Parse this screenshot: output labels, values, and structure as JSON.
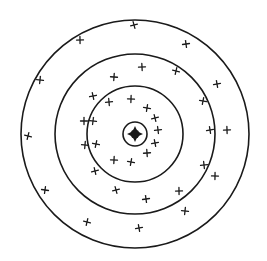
{
  "diagram": {
    "type": "target-scatter",
    "center": {
      "x": 135,
      "y": 134
    },
    "rings": [
      {
        "name": "outer-ring",
        "r": 114
      },
      {
        "name": "second-ring",
        "r": 80
      },
      {
        "name": "third-ring",
        "r": 48
      },
      {
        "name": "bullseye-ring",
        "r": 12
      }
    ],
    "bullseye": {
      "r": 6
    },
    "colors": {
      "stroke": "#1a1a1a",
      "background": "#ffffff"
    },
    "crosses": [
      [
        134,
        25
      ],
      [
        186,
        44
      ],
      [
        80,
        40
      ],
      [
        40,
        80
      ],
      [
        176,
        71
      ],
      [
        217,
        84
      ],
      [
        142,
        67
      ],
      [
        114,
        77
      ],
      [
        203,
        101
      ],
      [
        93,
        96
      ],
      [
        109,
        102
      ],
      [
        131,
        99
      ],
      [
        147,
        108
      ],
      [
        155,
        118
      ],
      [
        158,
        130
      ],
      [
        84,
        121
      ],
      [
        93,
        121
      ],
      [
        28,
        136
      ],
      [
        210,
        130
      ],
      [
        227,
        130
      ],
      [
        85,
        145
      ],
      [
        96,
        144
      ],
      [
        155,
        143
      ],
      [
        147,
        153
      ],
      [
        114,
        160
      ],
      [
        131,
        162
      ],
      [
        95,
        171
      ],
      [
        204,
        165
      ],
      [
        215,
        176
      ],
      [
        45,
        190
      ],
      [
        116,
        190
      ],
      [
        146,
        199
      ],
      [
        179,
        191
      ],
      [
        185,
        211
      ],
      [
        87,
        222
      ],
      [
        139,
        228
      ]
    ]
  }
}
